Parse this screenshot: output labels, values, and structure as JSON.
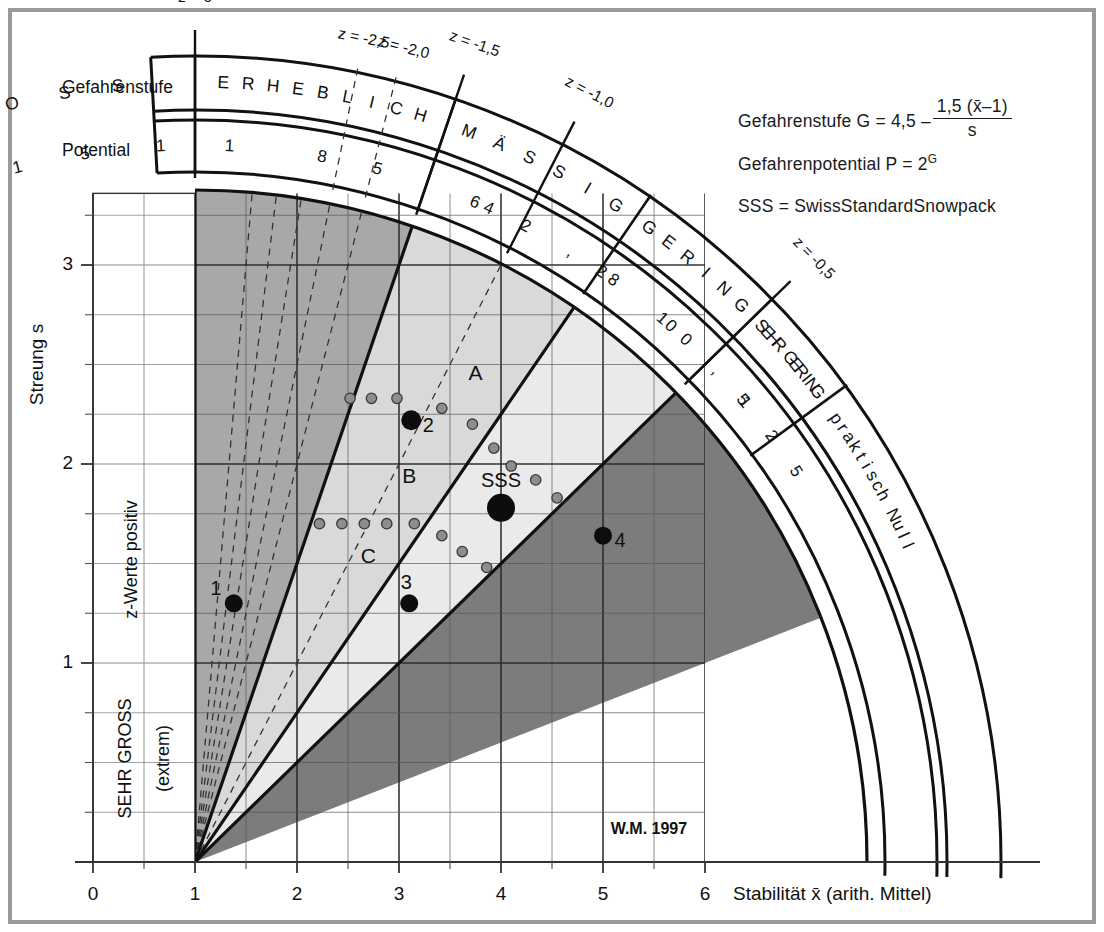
{
  "figure": {
    "credit": "W.M. 1997",
    "x_axis": {
      "title": "Stabilität x̄ (arith. Mittel)",
      "ticks": [
        "0",
        "1",
        "2",
        "3",
        "4",
        "5",
        "6"
      ],
      "min": 0,
      "max": 6
    },
    "y_axis": {
      "title": "Streung s",
      "ticks": [
        "1",
        "2",
        "3"
      ],
      "min": 0,
      "max": 3.35
    },
    "side_labels": {
      "z_positive": "z-Werte positiv",
      "sehr_gross": "SEHR GROSS",
      "extrem": "(extrem)"
    }
  },
  "legend": {
    "formula_lead": "Gefahrenstufe G = 4,5 –",
    "formula_numerator": "1,5 (x̄–1)",
    "formula_denominator": "s",
    "potential_line": "Gefahrenpotential P = 2",
    "potential_exp": "G",
    "sss_line": "SSS = SwissStandardSnowpack"
  },
  "scales": {
    "gefahrenstufe_label": "Gefahrenstufe",
    "potential_label": "Potential",
    "danger_levels": [
      "GROSS",
      "ERHEBLICH",
      "MÄSSIG",
      "GERING",
      "SEHR GERING",
      "praktisch Null"
    ],
    "potential_values": [
      "18",
      "15",
      "11",
      "8",
      "5,6",
      "4",
      "2,8",
      "2",
      "1",
      "0,5",
      "0,125"
    ]
  },
  "z_lines": [
    {
      "label": "z = 0",
      "value": 0
    },
    {
      "label": "z = -0,5",
      "value": -0.5
    },
    {
      "label": "z = -1,0",
      "value": -1.0
    },
    {
      "label": "z = -1,5",
      "value": -1.5
    },
    {
      "label": "z = -2,0",
      "value": -2.0
    },
    {
      "label": "z = -2,5",
      "value": -2.5
    }
  ],
  "region_labels": [
    {
      "text": "A",
      "x": 3.75,
      "y": 2.45
    },
    {
      "text": "B",
      "x": 3.1,
      "y": 1.93
    },
    {
      "text": "C",
      "x": 2.7,
      "y": 1.53
    }
  ],
  "points": [
    {
      "label": "1",
      "x": 1.38,
      "y": 1.3,
      "r": 9,
      "label_dx": -18,
      "label_dy": -14
    },
    {
      "label": "2",
      "x": 3.12,
      "y": 2.22,
      "r": 10,
      "label_dx": 17,
      "label_dy": 6
    },
    {
      "label": "3",
      "x": 3.1,
      "y": 1.3,
      "r": 9,
      "label_dx": -3,
      "label_dy": -20
    },
    {
      "label": "4",
      "x": 5.0,
      "y": 1.64,
      "r": 9,
      "label_dx": 17,
      "label_dy": 6
    },
    {
      "label": "SSS",
      "x": 4.0,
      "y": 1.78,
      "r": 14,
      "label_dx": 0,
      "label_dy": -26
    }
  ],
  "cloud_points": [
    {
      "x": 2.52,
      "y": 2.33
    },
    {
      "x": 2.73,
      "y": 2.33
    },
    {
      "x": 2.98,
      "y": 2.33
    },
    {
      "x": 3.42,
      "y": 2.28
    },
    {
      "x": 3.72,
      "y": 2.2
    },
    {
      "x": 3.93,
      "y": 2.08
    },
    {
      "x": 4.1,
      "y": 1.99
    },
    {
      "x": 4.34,
      "y": 1.92
    },
    {
      "x": 4.55,
      "y": 1.83
    },
    {
      "x": 2.22,
      "y": 1.7
    },
    {
      "x": 2.44,
      "y": 1.7
    },
    {
      "x": 2.66,
      "y": 1.7
    },
    {
      "x": 2.88,
      "y": 1.7
    },
    {
      "x": 3.15,
      "y": 1.7
    },
    {
      "x": 3.42,
      "y": 1.64
    },
    {
      "x": 3.62,
      "y": 1.56
    },
    {
      "x": 3.86,
      "y": 1.48
    }
  ],
  "colors": {
    "frame": "#9a9a9a",
    "dark": "#7c7c7c",
    "mid": "#a8a8a8",
    "light": "#d9d9d9",
    "lightest": "#eaeaea",
    "ink": "#111111",
    "grid": "#6b6b6b",
    "cloud": "#8d8d8d"
  }
}
